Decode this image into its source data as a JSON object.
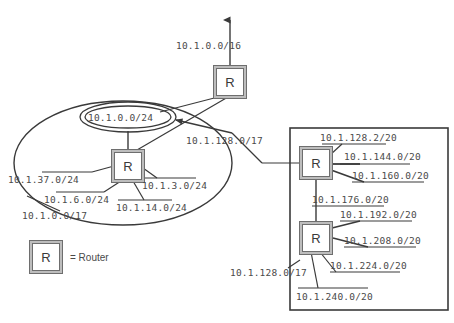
{
  "diagram": {
    "title_label": "10.1.0.0/16",
    "router_glyph": "R",
    "legend": {
      "equals_router": "= Router"
    },
    "top": {
      "uplink_label": "10.1.0.0/16"
    },
    "left_domain": {
      "summary_label": "10.1.0.0/17",
      "core_subnet": "10.1.0.0/24",
      "subnets": [
        "10.1.37.0/24",
        "10.1.6.0/24",
        "10.1.3.0/24",
        "10.1.14.0/24"
      ]
    },
    "right_domain": {
      "summary_label_top": "10.1.128.0/17",
      "summary_label_bottom": "10.1.128.0/17",
      "upper_router_subnets": [
        "10.1.128.2/20",
        "10.1.144.0/20",
        "10.1.160.0/20"
      ],
      "link_subnet": "10.1.176.0/20",
      "lower_router_subnets": [
        "10.1.192.0/20",
        "10.1.208.0/20",
        "10.1.224.0/20",
        "10.1.240.0/20"
      ]
    },
    "colors": {
      "stroke": "#3a3a3a",
      "text": "#4a4a4a",
      "router_inner": "#6e6e6e",
      "router_outer": "#bdbdbd"
    }
  }
}
